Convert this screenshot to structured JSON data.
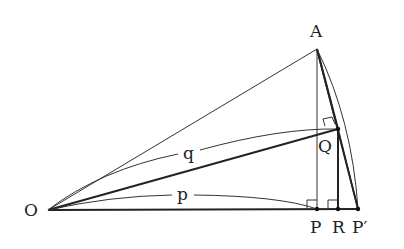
{
  "diagram": {
    "points": {
      "O": {
        "label": "O",
        "x": 48,
        "y": 210
      },
      "A": {
        "label": "A",
        "x": 317,
        "y": 49
      },
      "Q": {
        "label": "Q",
        "x": 338,
        "y": 129
      },
      "P": {
        "label": "P",
        "x": 317,
        "y": 209
      },
      "R": {
        "label": "R",
        "x": 338,
        "y": 209
      },
      "P_prime": {
        "label": "P′",
        "x": 358,
        "y": 209
      }
    },
    "arc_labels": {
      "q": "q",
      "p": "p"
    },
    "colors": {
      "line": "#222222",
      "background": "#ffffff"
    }
  }
}
